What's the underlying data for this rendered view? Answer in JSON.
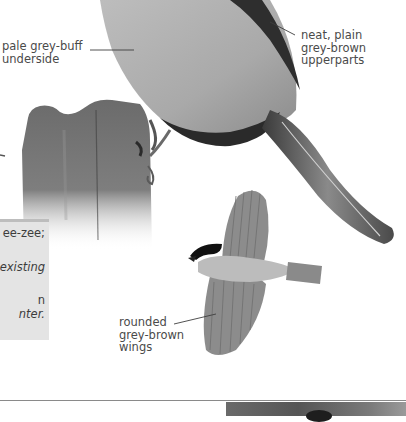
{
  "page": {
    "type": "field-guide-illustration"
  },
  "annotations": [
    {
      "id": "underside",
      "text": "pale grey-buff\nunderside"
    },
    {
      "id": "upperparts",
      "text": "neat, plain\ngrey-brown\nupperparts"
    },
    {
      "id": "wings",
      "text": "rounded\ngrey-brown\nwings"
    }
  ],
  "info_box": {
    "lines": [
      {
        "text": "ee-zee;",
        "italic": false
      },
      {
        "text": "existing",
        "italic": true
      },
      {
        "text": "n",
        "italic": false
      },
      {
        "text": "nter.",
        "italic": true
      }
    ]
  },
  "colors": {
    "page_bg": "#ffffff",
    "label_text": "#4a4a4a",
    "info_box_bg": "#e4e4e4",
    "info_box_border": "#bdbdbd",
    "rule": "#8a8a8a"
  }
}
